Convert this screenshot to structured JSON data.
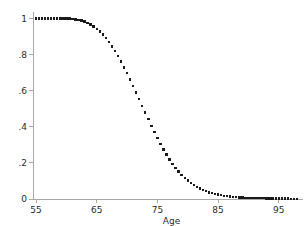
{
  "chart_data": {
    "type": "scatter",
    "title": "",
    "subtitle": "",
    "xlabel": "Age",
    "ylabel": "",
    "xlim": [
      54.5,
      98.5
    ],
    "ylim": [
      0,
      1.02
    ],
    "grid": false,
    "legend": null,
    "marker": {
      "shape": "square",
      "color": "#1a1a1a",
      "size_px": 2.4
    },
    "axis_color": "#a8a8a8",
    "background_color": "#ffffff",
    "xticks": [
      55,
      65,
      75,
      85,
      95
    ],
    "xtick_labels": [
      "55",
      "65",
      "75",
      "85",
      "95"
    ],
    "yticks": [
      0,
      0.2,
      0.4,
      0.6,
      0.8,
      1
    ],
    "ytick_labels": [
      "0",
      ".2",
      ".4",
      ".6",
      ".8",
      "1"
    ],
    "series": [
      {
        "name": "survival-probability",
        "x": [
          55,
          55.5,
          56,
          56.5,
          57,
          57.5,
          58,
          58.5,
          59,
          59.5,
          60,
          60.5,
          61,
          61.5,
          62,
          62.5,
          63,
          63.5,
          64,
          64.5,
          65,
          65.5,
          66,
          66.5,
          67,
          67.5,
          68,
          68.5,
          69,
          69.5,
          70,
          70.5,
          71,
          71.5,
          72,
          72.5,
          73,
          73.5,
          74,
          74.5,
          75,
          75.5,
          76,
          76.5,
          77,
          77.5,
          78,
          78.5,
          79,
          79.5,
          80,
          80.5,
          81,
          81.5,
          82,
          82.5,
          83,
          83.5,
          84,
          84.5,
          85,
          85.5,
          86,
          86.5,
          87,
          87.5,
          88,
          88.5,
          89,
          89.5,
          90,
          90.5,
          91,
          91.5,
          92,
          92.5,
          93,
          93.5,
          94,
          94.5,
          95,
          95.5,
          96,
          96.5,
          97,
          97.5,
          98
        ],
        "y": [
          1.0,
          1.0,
          1.0,
          1.0,
          1.0,
          1.0,
          1.0,
          1.0,
          1.0,
          1.0,
          1.0,
          1.0,
          0.998,
          0.996,
          0.993,
          0.989,
          0.983,
          0.976,
          0.967,
          0.956,
          0.943,
          0.928,
          0.911,
          0.892,
          0.87,
          0.846,
          0.82,
          0.792,
          0.762,
          0.73,
          0.697,
          0.662,
          0.627,
          0.59,
          0.553,
          0.516,
          0.479,
          0.442,
          0.406,
          0.371,
          0.337,
          0.305,
          0.274,
          0.246,
          0.219,
          0.195,
          0.172,
          0.152,
          0.134,
          0.117,
          0.102,
          0.089,
          0.078,
          0.067,
          0.058,
          0.05,
          0.043,
          0.037,
          0.032,
          0.028,
          0.024,
          0.021,
          0.018,
          0.016,
          0.014,
          0.012,
          0.011,
          0.009,
          0.008,
          0.007,
          0.006,
          0.006,
          0.005,
          0.005,
          0.004,
          0.004,
          0.003,
          0.003,
          0.003,
          0.002,
          0.002,
          0.002,
          0.002,
          0.002,
          0.001,
          0.001,
          0.001
        ]
      }
    ]
  }
}
